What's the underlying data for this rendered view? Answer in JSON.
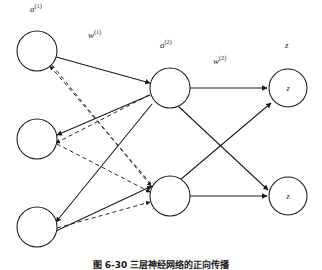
{
  "figure": {
    "caption": "图 6-30  三层神经网络的正向传播",
    "layers": [
      {
        "id": "input-layer",
        "name": "input",
        "label": "a",
        "label_superscript": "(1)",
        "nodes": [
          {
            "id": "input-node-1",
            "text": "",
            "cx": 37,
            "cy": 51,
            "r": 20
          },
          {
            "id": "input-node-2",
            "text": "",
            "cx": 37,
            "cy": 139,
            "r": 20
          },
          {
            "id": "input-node-3",
            "text": "",
            "cx": 37,
            "cy": 227,
            "r": 20
          }
        ]
      },
      {
        "id": "hidden-layer",
        "name": "hidden",
        "label": "a",
        "label_superscript": "(2)",
        "nodes": [
          {
            "id": "hidden-node-1",
            "text": "",
            "cx": 170,
            "cy": 88,
            "r": 20
          },
          {
            "id": "hidden-node-2",
            "text": "",
            "cx": 170,
            "cy": 196,
            "r": 20
          }
        ]
      },
      {
        "id": "output-layer",
        "name": "output",
        "label": "z",
        "label_superscript": "",
        "nodes": [
          {
            "id": "output-node-1",
            "text": "z",
            "cx": 288,
            "cy": 88,
            "r": 19
          },
          {
            "id": "output-node-2",
            "text": "z",
            "cx": 288,
            "cy": 196,
            "r": 19
          }
        ]
      }
    ],
    "edge_labels": [
      {
        "id": "weight-label-1",
        "base": "w",
        "superscript": "(1)",
        "x": 88,
        "y": 32
      },
      {
        "id": "weight-label-2",
        "base": "w",
        "superscript": "(2)",
        "x": 213,
        "y": 58
      }
    ],
    "layer_labels": [
      {
        "id": "layer-label-a1",
        "base": "a",
        "superscript": "(1)",
        "x": 30,
        "y": 6
      },
      {
        "id": "layer-label-a2",
        "base": "a",
        "superscript": "(2)",
        "x": 160,
        "y": 42
      },
      {
        "id": "layer-label-z",
        "base": "z",
        "superscript": "",
        "x": 285,
        "y": 42
      }
    ],
    "colors": {
      "stroke": "#1a1a1a",
      "node_fill": "#ffffff",
      "background": "#ffffff"
    }
  }
}
